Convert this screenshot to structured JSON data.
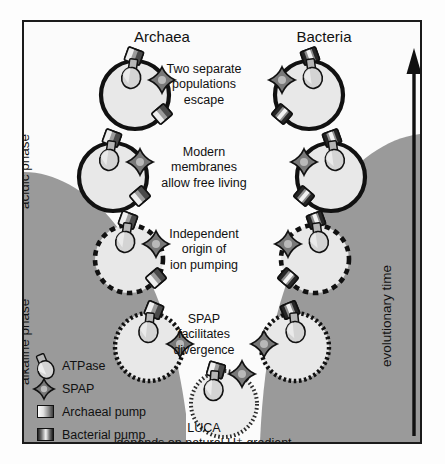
{
  "figure": {
    "headers": {
      "left": "Archaea",
      "right": "Bacteria"
    },
    "side_labels": {
      "acidic": "acidic phase",
      "alkaline": "alkaline phase",
      "time_axis": "evolutionary time"
    },
    "stages": [
      {
        "text": "Two separate\npopulations\nescape",
        "membrane": "solid"
      },
      {
        "text": "Modern\nmembranes\nallow free living",
        "membrane": "solid"
      },
      {
        "text": "Independent\norigin of\nion pumping",
        "membrane": "dashed-coarse"
      },
      {
        "text": "SPAP\nfacilitates\ndivergence",
        "membrane": "dotted-medium"
      }
    ],
    "luca": {
      "name": "LUCA",
      "subtitle": "depends on natural H⁺ gradient",
      "membrane": "dotted-fine"
    },
    "legend": [
      {
        "label": "ATPase",
        "icon": "atpase-icon"
      },
      {
        "label": "SPAP",
        "icon": "spap-icon"
      },
      {
        "label": "Archaeal pump",
        "icon": "archaeal-pump-icon"
      },
      {
        "label": "Bacterial pump",
        "icon": "bacterial-pump-icon"
      }
    ],
    "colors": {
      "alkaline_field": "#9a9a9a",
      "acidic_field": "#fbfbfb",
      "membrane": "#111111",
      "cell_interior": "#e8e8e8",
      "frame": "#1b1b1b"
    }
  }
}
